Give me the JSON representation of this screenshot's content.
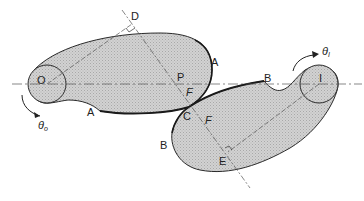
{
  "diagram": {
    "type": "mechanism-contact-diagram",
    "colors": {
      "body_fill": "#c9c9c9",
      "outline": "#2a2a2a",
      "construction_line": "#555555",
      "background": "#ffffff"
    },
    "pivots": [
      {
        "id": "O",
        "label": "O",
        "x": 47,
        "y": 84,
        "r": 19
      },
      {
        "id": "I",
        "label": "I",
        "x": 319,
        "y": 84,
        "r": 19
      }
    ],
    "points": [
      {
        "id": "D",
        "label": "D",
        "x": 132,
        "y": 24
      },
      {
        "id": "P",
        "label": "P",
        "x": 175,
        "y": 84
      },
      {
        "id": "C",
        "label": "C",
        "x": 189,
        "y": 107
      },
      {
        "id": "E",
        "label": "E",
        "x": 228,
        "y": 152
      }
    ],
    "labels": {
      "A_upper": "A",
      "A_lower": "A",
      "B_upper": "B",
      "B_lower": "B",
      "F_upper": "F",
      "F_lower": "F",
      "theta_o": "θ",
      "theta_o_sub": "o",
      "theta_i": "θ",
      "theta_i_sub": "I",
      "O": "O",
      "I": "I",
      "D": "D",
      "P": "P",
      "C": "C",
      "E": "E"
    }
  }
}
